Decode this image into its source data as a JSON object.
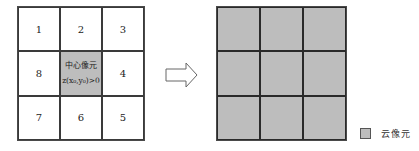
{
  "left_grid": {
    "cells": [
      "1",
      "2",
      "3",
      "8",
      "",
      "4",
      "7",
      "6",
      "5"
    ],
    "center": {
      "title": "中心像元",
      "condition": "z(x₀,y₀)>0"
    }
  },
  "right_grid": {
    "rows": 3,
    "cols": 3,
    "fill": "#bdbdbd"
  },
  "arrow": {
    "direction": "right"
  },
  "legend": {
    "swatch_color": "#bdbdbd",
    "label": "云像元"
  },
  "colors": {
    "cloud_pixel": "#bdbdbd",
    "line": "#3a3a3a"
  }
}
